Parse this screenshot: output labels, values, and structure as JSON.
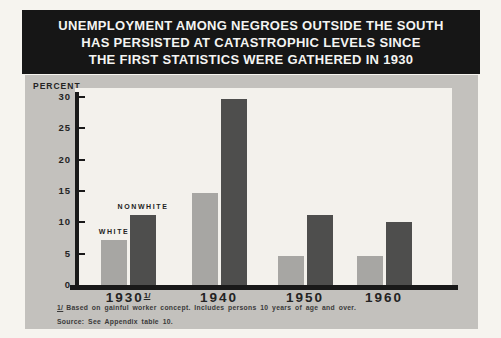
{
  "title": {
    "lines": [
      "UNEMPLOYMENT AMONG NEGROES OUTSIDE THE SOUTH",
      "HAS PERSISTED AT CATASTROPHIC LEVELS SINCE",
      "THE FIRST STATISTICS WERE GATHERED IN 1930"
    ]
  },
  "chart_data": {
    "type": "bar",
    "title": "UNEMPLOYMENT AMONG NEGROES OUTSIDE THE SOUTH HAS PERSISTED AT CATASTROPHIC LEVELS SINCE THE FIRST STATISTICS WERE GATHERED IN 1930",
    "ylabel": "PERCENT",
    "xlabel": "",
    "ylim": [
      0,
      30
    ],
    "yticks": [
      0,
      5,
      10,
      15,
      20,
      25,
      30
    ],
    "grid": "off",
    "legend_position": "labels-above-first-group",
    "categories": [
      "1930",
      "1940",
      "1950",
      "1960"
    ],
    "category_markers": [
      "1/",
      "",
      "",
      ""
    ],
    "series": [
      {
        "name": "WHITE",
        "color": "#a7a6a3",
        "values": [
          7.2,
          14.6,
          4.7,
          4.6
        ]
      },
      {
        "name": "NONWHITE",
        "color": "#4e4e4d",
        "values": [
          11.2,
          29.6,
          11.2,
          10.0
        ]
      }
    ]
  },
  "footnotes": {
    "marker": "1/",
    "note": "Based on gainful worker concept.  Includes persons 10 years of age and over.",
    "source": "Source: See Appendix table 10."
  },
  "colors": {
    "band_background": "#161616",
    "band_text": "#f4f4f2",
    "panel_background": "#c3c1bd",
    "plot_background": "#f3f1ec",
    "axis": "#191919",
    "white_bar": "#a7a6a3",
    "nonwhite_bar": "#4e4e4d"
  }
}
